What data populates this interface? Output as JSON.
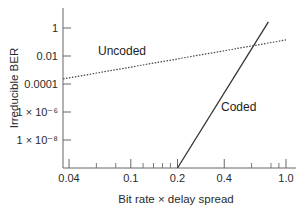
{
  "chart_data": {
    "type": "line",
    "title": "",
    "xlabel": "Bit rate × delay spread",
    "ylabel": "Irreducible BER",
    "xscale": "log",
    "yscale": "log",
    "xlim": [
      0.0366,
      1.05
    ],
    "ylim": [
      1e-10,
      10
    ],
    "grid": false,
    "legend": "inline labels",
    "x_ticks": [
      {
        "value": 0.04,
        "label": "0.04"
      },
      {
        "value": 0.1,
        "label": "0.1"
      },
      {
        "value": 0.2,
        "label": "0.2"
      },
      {
        "value": 0.4,
        "label": "0.4"
      },
      {
        "value": 1.0,
        "label": "1.0"
      }
    ],
    "x_minor_ticks": [
      0.06,
      0.08,
      0.12,
      0.14,
      0.16,
      0.18,
      0.6,
      0.8,
      0.9
    ],
    "y_ticks": [
      {
        "value": 1,
        "label": "1"
      },
      {
        "value": 0.01,
        "label": "0.01"
      },
      {
        "value": 0.0001,
        "label": "0.0001"
      },
      {
        "value": 1e-06,
        "label": "1 × 10⁻⁶"
      },
      {
        "value": 1e-08,
        "label": "1 × 10⁻⁸"
      }
    ],
    "series": [
      {
        "name": "Uncoded",
        "style": "dotted",
        "x": [
          0.0366,
          1.0
        ],
        "y": [
          0.00023,
          0.14
        ]
      },
      {
        "name": "Coded",
        "style": "solid",
        "x": [
          0.2,
          0.77
        ],
        "y": [
          1e-10,
          2.7
        ]
      }
    ],
    "annotations": [
      {
        "text": "Uncoded",
        "x": 0.12,
        "y": 0.03
      },
      {
        "text": "Coded",
        "x": 0.45,
        "y": 1e-06
      }
    ]
  },
  "colors": {
    "axis": "#555555",
    "line": "#333333"
  }
}
